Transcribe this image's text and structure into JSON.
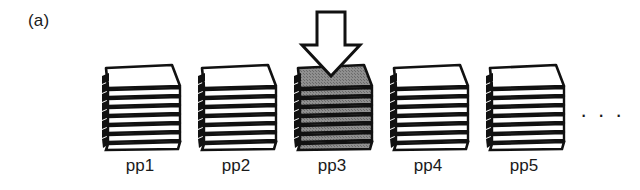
{
  "figure": {
    "panel_label": "(a)",
    "ellipsis": "· · ·",
    "background_color": "#ffffff",
    "ink_color": "#111111"
  },
  "arrow": {
    "name": "down-arrow",
    "direction": "down",
    "points_at": "pp3",
    "fill_color": "#ffffff",
    "stroke_color": "#111111"
  },
  "stacks": [
    {
      "id": "pp1",
      "label": "pp1",
      "sheet_count": 8,
      "highlighted": false,
      "fill_color": "#ffffff",
      "x": 100
    },
    {
      "id": "pp2",
      "label": "pp2",
      "sheet_count": 8,
      "highlighted": false,
      "fill_color": "#ffffff",
      "x": 196
    },
    {
      "id": "pp3",
      "label": "pp3",
      "sheet_count": 8,
      "highlighted": true,
      "fill_color": "#8a8a8a",
      "x": 292
    },
    {
      "id": "pp4",
      "label": "pp4",
      "sheet_count": 8,
      "highlighted": false,
      "fill_color": "#ffffff",
      "x": 388
    },
    {
      "id": "pp5",
      "label": "pp5",
      "sheet_count": 8,
      "highlighted": false,
      "fill_color": "#ffffff",
      "x": 484
    }
  ]
}
